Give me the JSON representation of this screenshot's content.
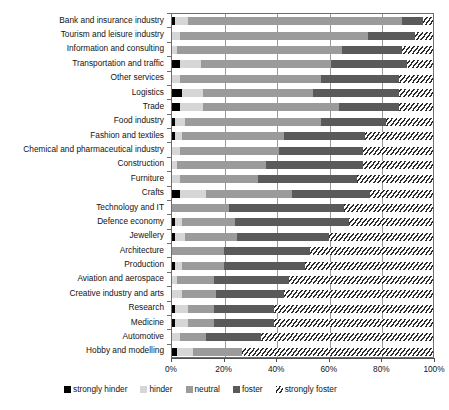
{
  "chart_data": {
    "type": "bar",
    "subtype": "stacked-horizontal-100-percent",
    "title": "",
    "xlabel": "",
    "ylabel": "",
    "xlim": [
      0,
      100
    ],
    "xticks": [
      0,
      20,
      40,
      60,
      80,
      100
    ],
    "xtick_labels": [
      "0%",
      "20%",
      "40%",
      "60%",
      "80%",
      "100%"
    ],
    "grid": true,
    "grid_axis": "x",
    "legend_position": "bottom",
    "categories": [
      "Bank and insurance industry",
      "Tourism and leisure industry",
      "Information and consulting",
      "Transportation and traffic",
      "Other services",
      "Logistics",
      "Trade",
      "Food industry",
      "Fashion and textiles",
      "Chemical and pharmaceutical industry",
      "Construction",
      "Furniture",
      "Crafts",
      "Technology and IT",
      "Defence economy",
      "Jewellery",
      "Architecture",
      "Production",
      "Aviation and aerospace",
      "Creative industry and arts",
      "Research",
      "Medicine",
      "Automotive",
      "Hobby and modelling"
    ],
    "series": [
      {
        "name": "strongly hinder",
        "color": "#000000",
        "values": [
          1,
          0,
          0,
          3,
          0,
          4,
          3,
          1,
          1,
          0,
          0,
          0,
          3,
          0,
          1,
          1,
          0,
          1,
          0,
          0,
          1,
          1,
          0,
          2
        ]
      },
      {
        "name": "hinder",
        "color": "#d6d6d6",
        "values": [
          5,
          3,
          2,
          8,
          3,
          8,
          9,
          4,
          3,
          3,
          2,
          3,
          10,
          0,
          3,
          4,
          0,
          3,
          2,
          4,
          5,
          5,
          3,
          6
        ]
      },
      {
        "name": "neutral",
        "color": "#9b9b9b",
        "values": [
          82,
          72,
          63,
          50,
          54,
          42,
          52,
          52,
          39,
          38,
          34,
          30,
          33,
          22,
          20,
          20,
          20,
          16,
          14,
          13,
          10,
          10,
          10,
          19
        ]
      },
      {
        "name": "foster",
        "color": "#5a5a5a",
        "values": [
          8,
          18,
          23,
          29,
          30,
          33,
          23,
          25,
          31,
          32,
          37,
          38,
          30,
          44,
          44,
          35,
          33,
          31,
          29,
          26,
          23,
          23,
          21,
          0
        ]
      },
      {
        "name": "strongly foster",
        "color": "hatched",
        "values": [
          4,
          7,
          12,
          10,
          13,
          13,
          13,
          18,
          26,
          27,
          27,
          29,
          24,
          34,
          32,
          40,
          47,
          49,
          55,
          57,
          61,
          61,
          66,
          73
        ]
      }
    ]
  },
  "legend": {
    "items": [
      {
        "label": "strongly hinder",
        "swatch": "sw-strongly-hinder"
      },
      {
        "label": "hinder",
        "swatch": "sw-hinder"
      },
      {
        "label": "neutral",
        "swatch": "sw-neutral"
      },
      {
        "label": "foster",
        "swatch": "sw-foster"
      },
      {
        "label": "strongly foster",
        "swatch": "sw-strongly-foster"
      }
    ]
  }
}
